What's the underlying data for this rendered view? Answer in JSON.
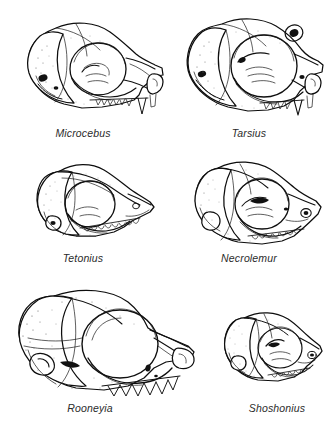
{
  "plate": {
    "background_color": "#ffffff",
    "ink_color": "#0f0f0f",
    "caption_color": "#2b2b2b",
    "layout": "3 rows x 2 columns",
    "subject": "lateral-view primate skull illustrations"
  },
  "figures": [
    {
      "id": "microcebus",
      "label": "Microcebus",
      "row": 1,
      "column": 1,
      "icon": "skull-lateral-icon",
      "orientation": "facing right",
      "relative_size": "small"
    },
    {
      "id": "tarsius",
      "label": "Tarsius",
      "row": 1,
      "column": 2,
      "icon": "skull-lateral-icon",
      "orientation": "facing right",
      "relative_size": "small"
    },
    {
      "id": "tetonius",
      "label": "Tetonius",
      "row": 2,
      "column": 1,
      "icon": "skull-lateral-icon",
      "orientation": "facing right",
      "relative_size": "small"
    },
    {
      "id": "necrolemur",
      "label": "Necrolemur",
      "row": 2,
      "column": 2,
      "icon": "skull-lateral-icon",
      "orientation": "facing right",
      "relative_size": "small"
    },
    {
      "id": "rooneyia",
      "label": "Rooneyia",
      "row": 3,
      "column": 1,
      "icon": "skull-lateral-icon",
      "orientation": "facing right",
      "relative_size": "large"
    },
    {
      "id": "shoshonius",
      "label": "Shoshonius",
      "row": 3,
      "column": 2,
      "icon": "skull-lateral-icon",
      "orientation": "facing right",
      "relative_size": "small"
    }
  ]
}
